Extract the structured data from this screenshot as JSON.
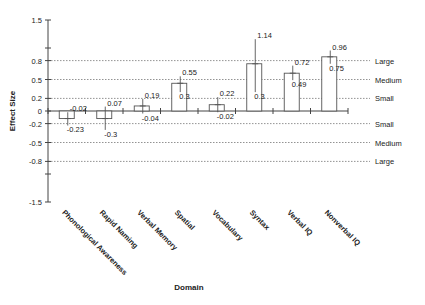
{
  "chart_data": {
    "type": "bar",
    "title": "",
    "xlabel": "Domain",
    "ylabel": "Effect Size",
    "ylim": [
      -1.5,
      1.5
    ],
    "y_tick_labels": [
      "1.5",
      "0.8",
      "0.5",
      "0.2",
      "0",
      "-0.2",
      "-0.5",
      "-0.8",
      "-1.5"
    ],
    "y_tick_values": [
      1.5,
      0.8,
      0.5,
      0.2,
      0,
      -0.2,
      -0.5,
      -0.8,
      -1.5
    ],
    "grid": "dotted reference lines at ±0.2, ±0.5, ±0.8",
    "reference_lines": [
      {
        "value": 0.8,
        "label": "Large"
      },
      {
        "value": 0.5,
        "label": "Medium"
      },
      {
        "value": 0.2,
        "label": "Small"
      },
      {
        "value": -0.2,
        "label": "Small"
      },
      {
        "value": -0.5,
        "label": "Medium"
      },
      {
        "value": -0.8,
        "label": "Large"
      }
    ],
    "categories": [
      "Phonological Awareness",
      "Rapid Naming",
      "Verbal Memory",
      "Spatial",
      "Vocabulary",
      "Syntax",
      "Verbal IQ",
      "Nonverbal IQ"
    ],
    "values": [
      -0.12,
      -0.12,
      0.08,
      0.44,
      0.1,
      0.75,
      0.6,
      0.86
    ],
    "ci_upper": [
      -0.02,
      0.07,
      0.19,
      0.55,
      0.22,
      1.14,
      0.72,
      0.96
    ],
    "ci_lower": [
      -0.23,
      -0.3,
      -0.04,
      0.3,
      -0.02,
      0.3,
      0.49,
      0.75
    ],
    "ci_upper_labels": [
      "-0.02",
      "0.07",
      "0.19",
      "0.55",
      "0.22",
      "1.14",
      "0.72",
      "0.96"
    ],
    "ci_lower_labels": [
      "-0.23",
      "-0.3",
      "-0.04",
      "0.3",
      "-0.02",
      "0.3",
      "0.49",
      "0.75"
    ],
    "legend": "none"
  }
}
